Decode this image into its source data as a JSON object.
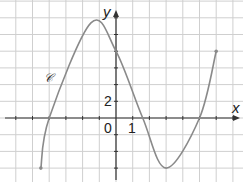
{
  "chart_data": {
    "type": "line",
    "title": "",
    "curve_label": "𝒞",
    "xlabel": "x",
    "ylabel": "y",
    "origin_label": "0",
    "x_tick_label": "1",
    "y_tick_label": "2",
    "x_unit_per_grid": 1,
    "y_unit_per_grid": 2,
    "xlim": [
      -7,
      7.5
    ],
    "ylim": [
      -8,
      14
    ],
    "grid": true,
    "points": [
      {
        "x": -4.5,
        "y": -6,
        "note": "left endpoint"
      },
      {
        "x": -4,
        "y": 0,
        "note": "zero"
      },
      {
        "x": -1.5,
        "y": 11.4,
        "note": "local maximum"
      },
      {
        "x": 0,
        "y": 8,
        "note": "y-intercept"
      },
      {
        "x": 1.6,
        "y": 0,
        "note": "zero"
      },
      {
        "x": 3,
        "y": -6,
        "note": "local minimum"
      },
      {
        "x": 5,
        "y": 0,
        "note": "zero"
      },
      {
        "x": 6,
        "y": 8,
        "note": "right endpoint"
      }
    ]
  }
}
